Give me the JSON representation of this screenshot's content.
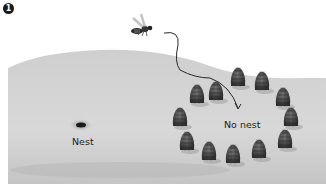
{
  "figure": {
    "step_number": "1",
    "labels": {
      "nest": "Nest",
      "no_nest": "No nest"
    },
    "elements": {
      "insect": "wasp-icon",
      "flight_path": "curved-arrow",
      "nest_hole": "nest-hole-icon",
      "pine_cone_ring": {
        "icon": "pine-cone-icon",
        "count": 12
      }
    },
    "colors": {
      "ground_light": "#d6d6d6",
      "ground_dark": "#b8b8b8",
      "cone": "#4a4a4a",
      "path": "#2a2a2a"
    }
  }
}
